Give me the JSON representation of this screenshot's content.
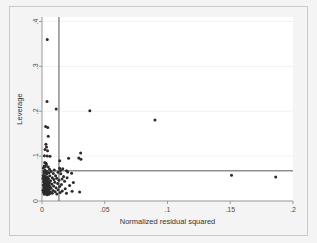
{
  "chart_data": {
    "type": "scatter",
    "title": "",
    "xlabel": "Normalized residual squared",
    "ylabel": "Leverage",
    "xlim": [
      0,
      0.2
    ],
    "ylim": [
      0,
      0.41
    ],
    "xticks": [
      0,
      0.05,
      0.1,
      0.15,
      0.2
    ],
    "xticklabels": [
      "0",
      ".05",
      ".1",
      ".15",
      ".2"
    ],
    "yticks": [
      0,
      0.1,
      0.2,
      0.3,
      0.4
    ],
    "yticklabels": [
      "0",
      ".1",
      ".2",
      ".3",
      ".4"
    ],
    "grid": true,
    "grid_axis": "y",
    "legend": "none",
    "marker_color": "#2b2b2b",
    "marker_size": 3.0,
    "reference_lines": [
      {
        "orientation": "vertical",
        "value": 0.0135,
        "color": "#55555f"
      },
      {
        "orientation": "horizontal",
        "value": 0.0672,
        "color": "#55555f"
      }
    ],
    "series": [
      {
        "name": "observations",
        "points": [
          [
            0.0042,
            0.36
          ],
          [
            0.004,
            0.2215
          ],
          [
            0.0113,
            0.2048
          ],
          [
            0.0381,
            0.201
          ],
          [
            0.09,
            0.1805
          ],
          [
            0.0029,
            0.1658
          ],
          [
            0.0046,
            0.164
          ],
          [
            0.005,
            0.1445
          ],
          [
            0.0031,
            0.1265
          ],
          [
            0.0036,
            0.1205
          ],
          [
            0.0024,
            0.115
          ],
          [
            0.0044,
            0.112
          ],
          [
            0.0308,
            0.107
          ],
          [
            0.0019,
            0.101
          ],
          [
            0.0042,
            0.1
          ],
          [
            0.0064,
            0.0995
          ],
          [
            0.0293,
            0.096
          ],
          [
            0.0212,
            0.0955
          ],
          [
            0.031,
            0.093
          ],
          [
            0.0141,
            0.0898
          ],
          [
            0.0022,
            0.086
          ],
          [
            0.0032,
            0.084
          ],
          [
            0.0035,
            0.0805
          ],
          [
            0.0018,
            0.078
          ],
          [
            0.0026,
            0.077
          ],
          [
            0.005,
            0.0755
          ],
          [
            0.0011,
            0.0735
          ],
          [
            0.014,
            0.073
          ],
          [
            0.0165,
            0.072
          ],
          [
            0.006,
            0.0705
          ],
          [
            0.0024,
            0.069
          ],
          [
            0.0098,
            0.0688
          ],
          [
            0.0148,
            0.068
          ],
          [
            0.0196,
            0.0672
          ],
          [
            0.004,
            0.066
          ],
          [
            0.0072,
            0.0655
          ],
          [
            0.0015,
            0.065
          ],
          [
            0.0205,
            0.0645
          ],
          [
            0.0128,
            0.064
          ],
          [
            0.003,
            0.0632
          ],
          [
            0.0055,
            0.0628
          ],
          [
            0.0018,
            0.062
          ],
          [
            0.0236,
            0.0618
          ],
          [
            0.009,
            0.061
          ],
          [
            0.015,
            0.0605
          ],
          [
            0.0038,
            0.06
          ],
          [
            0.151,
            0.0572
          ],
          [
            0.001,
            0.057
          ],
          [
            0.0062,
            0.0565
          ],
          [
            0.0108,
            0.056
          ],
          [
            0.0026,
            0.0552
          ],
          [
            0.0172,
            0.0548
          ],
          [
            0.1862,
            0.0532
          ],
          [
            0.0044,
            0.053
          ],
          [
            0.0014,
            0.0525
          ],
          [
            0.0082,
            0.052
          ],
          [
            0.02,
            0.0518
          ],
          [
            0.0032,
            0.051
          ],
          [
            0.0118,
            0.0505
          ],
          [
            0.0008,
            0.05
          ],
          [
            0.0052,
            0.0495
          ],
          [
            0.016,
            0.049
          ],
          [
            0.0024,
            0.0482
          ],
          [
            0.0095,
            0.0478
          ],
          [
            0.004,
            0.047
          ],
          [
            0.0135,
            0.0465
          ],
          [
            0.0016,
            0.0458
          ],
          [
            0.0068,
            0.0452
          ],
          [
            0.0028,
            0.0445
          ],
          [
            0.018,
            0.044
          ],
          [
            0.005,
            0.0432
          ],
          [
            0.0012,
            0.0428
          ],
          [
            0.0102,
            0.042
          ],
          [
            0.0036,
            0.0415
          ],
          [
            0.025,
            0.041
          ],
          [
            0.006,
            0.0402
          ],
          [
            0.002,
            0.0398
          ],
          [
            0.0125,
            0.039
          ],
          [
            0.0044,
            0.0385
          ],
          [
            0.0078,
            0.0378
          ],
          [
            0.003,
            0.0372
          ],
          [
            0.0155,
            0.0365
          ],
          [
            0.001,
            0.0358
          ],
          [
            0.0055,
            0.0352
          ],
          [
            0.022,
            0.0348
          ],
          [
            0.0038,
            0.034
          ],
          [
            0.0092,
            0.0335
          ],
          [
            0.0018,
            0.0328
          ],
          [
            0.014,
            0.0322
          ],
          [
            0.0064,
            0.0315
          ],
          [
            0.0026,
            0.031
          ],
          [
            0.0048,
            0.0302
          ],
          [
            0.0112,
            0.0298
          ],
          [
            0.0014,
            0.029
          ],
          [
            0.0072,
            0.0285
          ],
          [
            0.0034,
            0.0278
          ],
          [
            0.0185,
            0.0272
          ],
          [
            0.0022,
            0.0265
          ],
          [
            0.0058,
            0.0258
          ],
          [
            0.0128,
            0.0252
          ],
          [
            0.0042,
            0.0245
          ],
          [
            0.0008,
            0.024
          ],
          [
            0.0088,
            0.0232
          ],
          [
            0.0028,
            0.0228
          ],
          [
            0.0162,
            0.0222
          ],
          [
            0.005,
            0.0218
          ],
          [
            0.024,
            0.0215
          ],
          [
            0.0016,
            0.021
          ],
          [
            0.0105,
            0.0208
          ],
          [
            0.0036,
            0.0202
          ],
          [
            0.03,
            0.02
          ],
          [
            0.0068,
            0.0198
          ],
          [
            0.0012,
            0.0192
          ],
          [
            0.0145,
            0.019
          ],
          [
            0.0045,
            0.0185
          ],
          [
            0.0024,
            0.018
          ],
          [
            0.0082,
            0.0175
          ],
          [
            0.0195,
            0.0172
          ],
          [
            0.0032,
            0.0168
          ],
          [
            0.006,
            0.0162
          ],
          [
            0.0118,
            0.0158
          ],
          [
            0.0019,
            0.0152
          ],
          [
            0.0052,
            0.0148
          ],
          [
            0.004,
            0.0142
          ]
        ]
      }
    ]
  }
}
